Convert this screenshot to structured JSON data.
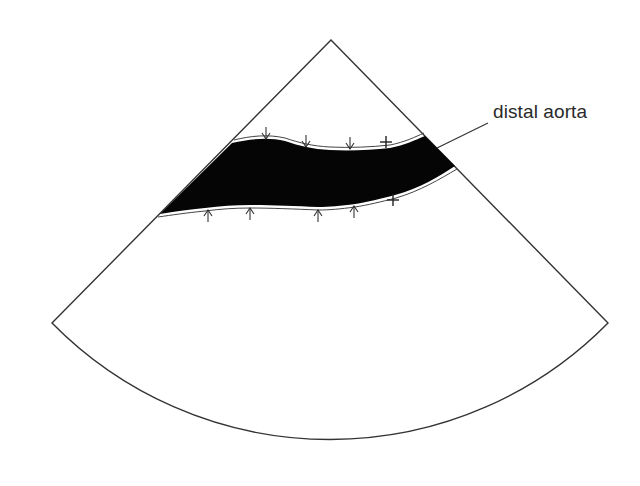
{
  "diagram": {
    "type": "ultrasound-sector-schematic",
    "labels": {
      "vessel": "distal aorta"
    },
    "colors": {
      "outline": "#333333",
      "lumen": "#050505",
      "background": "#ffffff",
      "wall_highlight": "#ffffff"
    },
    "markers": {
      "anterior_wall_arrows": 3,
      "posterior_wall_arrows": 4,
      "calipers": 2
    }
  }
}
